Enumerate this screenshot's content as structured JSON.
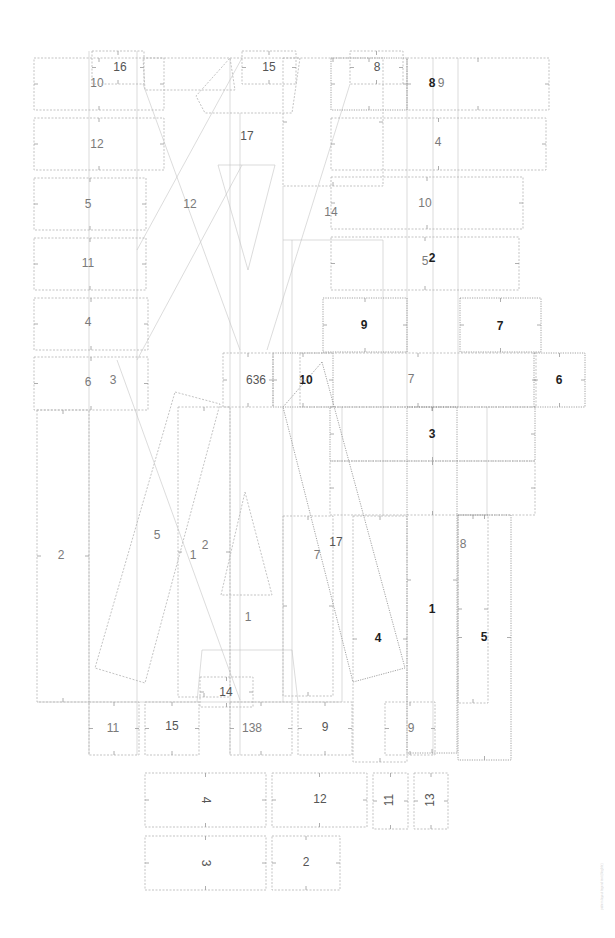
{
  "diagram": {
    "type": "sewing-pattern-layout",
    "background": "#ffffff",
    "stroke_color": "#b4b4b4",
    "label_colors": {
      "light": "#7a7a7a",
      "medium": "#555555",
      "bold": "#1e1e1e"
    },
    "footnote": "pattern layout legend text (illegible)",
    "pieces": [
      {
        "id": "p10a",
        "label": "10",
        "style": "light",
        "shape": "rect",
        "x": 34,
        "y": 58,
        "w": 130,
        "h": 52,
        "lx": 97,
        "ly": 84
      },
      {
        "id": "p16",
        "label": "16",
        "style": "medium",
        "shape": "rect",
        "x": 92,
        "y": 51,
        "w": 52,
        "h": 33,
        "lx": 120,
        "ly": 68
      },
      {
        "id": "p12a",
        "label": "12",
        "style": "light",
        "shape": "rect",
        "x": 34,
        "y": 118,
        "w": 130,
        "h": 52,
        "lx": 97,
        "ly": 145
      },
      {
        "id": "p5a",
        "label": "5",
        "style": "light",
        "shape": "rect",
        "x": 34,
        "y": 178,
        "w": 112,
        "h": 52,
        "lx": 88,
        "ly": 205
      },
      {
        "id": "p11a",
        "label": "11",
        "style": "light",
        "shape": "rect",
        "x": 34,
        "y": 238,
        "w": 112,
        "h": 52,
        "lx": 88,
        "ly": 264
      },
      {
        "id": "p4a",
        "label": "4",
        "style": "light",
        "shape": "rect",
        "x": 34,
        "y": 298,
        "w": 114,
        "h": 52,
        "lx": 88,
        "ly": 323
      },
      {
        "id": "p6a",
        "label": "6",
        "style": "light",
        "shape": "rect",
        "x": 34,
        "y": 357,
        "w": 114,
        "h": 53,
        "lx": 88,
        "ly": 383
      },
      {
        "id": "p3a",
        "label": "3",
        "style": "light",
        "shape": "none",
        "lx": 113,
        "ly": 381
      },
      {
        "id": "p2a",
        "label": "2",
        "style": "light",
        "shape": "rect",
        "x": 37,
        "y": 410,
        "w": 52,
        "h": 292,
        "lx": 61,
        "ly": 556
      },
      {
        "id": "p12b",
        "label": "12",
        "style": "light",
        "shape": "poly",
        "points": "143,58 230,58 235,90 145,90",
        "lx": 190,
        "ly": 205
      },
      {
        "id": "p15a",
        "label": "15",
        "style": "medium",
        "shape": "rect",
        "x": 242,
        "y": 51,
        "w": 54,
        "h": 33,
        "lx": 269,
        "ly": 68
      },
      {
        "id": "p17",
        "label": "17",
        "style": "medium",
        "shape": "poly",
        "points": "230,58 300,58 292,113 205,113 196,96",
        "lx": 247,
        "ly": 137
      },
      {
        "id": "p8a",
        "label": "8",
        "style": "medium",
        "shape": "rect",
        "x": 350,
        "y": 51,
        "w": 53,
        "h": 33,
        "lx": 377,
        "ly": 68
      },
      {
        "id": "p8b",
        "label": "8",
        "style": "bold",
        "shape": "rect",
        "x": 331,
        "y": 58,
        "w": 76,
        "h": 52,
        "lx": 432,
        "ly": 84
      },
      {
        "id": "p9a",
        "label": "9",
        "style": "light",
        "shape": "rect",
        "x": 407,
        "y": 58,
        "w": 142,
        "h": 52,
        "lx": 441,
        "ly": 84
      },
      {
        "id": "p4b",
        "label": "4",
        "style": "light",
        "shape": "rect",
        "x": 331,
        "y": 118,
        "w": 215,
        "h": 52,
        "lx": 438,
        "ly": 143
      },
      {
        "id": "p14a",
        "label": "14",
        "style": "light",
        "shape": "rect",
        "x": 283,
        "y": 58,
        "w": 100,
        "h": 128,
        "lx": 331,
        "ly": 213
      },
      {
        "id": "p10b",
        "label": "10",
        "style": "light",
        "shape": "rect",
        "x": 331,
        "y": 177,
        "w": 192,
        "h": 52,
        "lx": 425,
        "ly": 204
      },
      {
        "id": "p5b",
        "label": "5",
        "style": "light",
        "shape": "rect",
        "x": 331,
        "y": 237,
        "w": 188,
        "h": 53,
        "lx": 425,
        "ly": 262
      },
      {
        "id": "p2b",
        "label": "2",
        "style": "bold",
        "shape": "none",
        "lx": 432,
        "ly": 259
      },
      {
        "id": "p9b",
        "label": "9",
        "style": "bold",
        "shape": "rect",
        "x": 323,
        "y": 298,
        "w": 84,
        "h": 54,
        "lx": 364,
        "ly": 326
      },
      {
        "id": "p7a",
        "label": "7",
        "style": "bold",
        "shape": "rect",
        "x": 460,
        "y": 298,
        "w": 81,
        "h": 54,
        "lx": 500,
        "ly": 327
      },
      {
        "id": "p636",
        "label": "636",
        "style": "medium",
        "shape": "rect",
        "x": 223,
        "y": 353,
        "w": 50,
        "h": 54,
        "lx": 256,
        "ly": 381
      },
      {
        "id": "p10c",
        "label": "10",
        "style": "bold",
        "shape": "rect",
        "x": 273,
        "y": 353,
        "w": 60,
        "h": 54,
        "lx": 306,
        "ly": 381
      },
      {
        "id": "p7b",
        "label": "7",
        "style": "light",
        "shape": "rect",
        "x": 300,
        "y": 353,
        "w": 236,
        "h": 54,
        "lx": 411,
        "ly": 380
      },
      {
        "id": "p6b",
        "label": "6",
        "style": "bold",
        "shape": "rect",
        "x": 534,
        "y": 353,
        "w": 51,
        "h": 54,
        "lx": 559,
        "ly": 381
      },
      {
        "id": "p3b",
        "label": "3",
        "style": "bold",
        "shape": "rect",
        "x": 330,
        "y": 407,
        "w": 205,
        "h": 54,
        "lx": 432,
        "ly": 435
      },
      {
        "id": "p3c",
        "label": "",
        "style": "light",
        "shape": "rect",
        "x": 330,
        "y": 461,
        "w": 205,
        "h": 54
      },
      {
        "id": "p5c",
        "label": "5",
        "style": "light",
        "shape": "poly",
        "points": "175,392 220,404 145,683 95,668",
        "lx": 157,
        "ly": 536
      },
      {
        "id": "p1a",
        "label": "1",
        "style": "light",
        "shape": "rect",
        "x": 178,
        "y": 407,
        "w": 52,
        "h": 290,
        "lx": 193,
        "ly": 556
      },
      {
        "id": "p2c",
        "label": "2",
        "style": "light",
        "shape": "none",
        "lx": 205,
        "ly": 546
      },
      {
        "id": "p1b",
        "label": "1",
        "style": "light",
        "shape": "poly",
        "points": "245,492 272,595 221,595",
        "lx": 248,
        "ly": 618
      },
      {
        "id": "p7c",
        "label": "7",
        "style": "light",
        "shape": "rect",
        "x": 283,
        "y": 516,
        "w": 50,
        "h": 180,
        "lx": 317,
        "ly": 556
      },
      {
        "id": "p17b",
        "label": "17",
        "style": "medium",
        "shape": "none",
        "lx": 336,
        "ly": 543
      },
      {
        "id": "p4c",
        "label": "4",
        "style": "bold",
        "shape": "poly",
        "points": "322,362 405,668 353,682 283,407",
        "lx": 378,
        "ly": 639
      },
      {
        "id": "p4d",
        "label": "",
        "style": "light",
        "shape": "rect",
        "x": 353,
        "y": 516,
        "w": 54,
        "h": 246
      },
      {
        "id": "p1c",
        "label": "1",
        "style": "bold",
        "shape": "rect",
        "x": 407,
        "y": 407,
        "w": 50,
        "h": 346,
        "lx": 432,
        "ly": 610
      },
      {
        "id": "p8c",
        "label": "8",
        "style": "light",
        "shape": "rect",
        "x": 458,
        "y": 515,
        "w": 30,
        "h": 188,
        "lx": 463,
        "ly": 545
      },
      {
        "id": "p5d",
        "label": "5",
        "style": "bold",
        "shape": "rect",
        "x": 458,
        "y": 515,
        "w": 53,
        "h": 245,
        "lx": 484,
        "ly": 638
      },
      {
        "id": "p14b",
        "label": "14",
        "style": "medium",
        "shape": "rect",
        "x": 200,
        "y": 677,
        "w": 53,
        "h": 30,
        "lx": 226,
        "ly": 693
      },
      {
        "id": "p11b",
        "label": "11",
        "style": "light",
        "shape": "rect",
        "x": 89,
        "y": 702,
        "w": 50,
        "h": 53,
        "lx": 113,
        "ly": 729
      },
      {
        "id": "p15b",
        "label": "15",
        "style": "medium",
        "shape": "rect",
        "x": 145,
        "y": 702,
        "w": 54,
        "h": 53,
        "lx": 172,
        "ly": 727
      },
      {
        "id": "p138",
        "label": "138",
        "style": "light",
        "shape": "rect",
        "x": 230,
        "y": 702,
        "w": 62,
        "h": 53,
        "lx": 252,
        "ly": 729
      },
      {
        "id": "p9c",
        "label": "9",
        "style": "medium",
        "shape": "rect",
        "x": 298,
        "y": 702,
        "w": 54,
        "h": 53,
        "lx": 325,
        "ly": 728
      },
      {
        "id": "p9d",
        "label": "9",
        "style": "light",
        "shape": "rect",
        "x": 385,
        "y": 702,
        "w": 50,
        "h": 53,
        "lx": 411,
        "ly": 729
      },
      {
        "id": "p4e",
        "label": "4",
        "style": "medium",
        "shape": "rect",
        "x": 145,
        "y": 773,
        "w": 121,
        "h": 54,
        "lx": 205,
        "ly": 800,
        "rotate": 90
      },
      {
        "id": "p12c",
        "label": "12",
        "style": "medium",
        "shape": "rect",
        "x": 272,
        "y": 773,
        "w": 95,
        "h": 54,
        "lx": 320,
        "ly": 800
      },
      {
        "id": "p11c",
        "label": "11",
        "style": "medium",
        "shape": "rect",
        "x": 373,
        "y": 773,
        "w": 35,
        "h": 56,
        "lx": 390,
        "ly": 800,
        "rotate": -90
      },
      {
        "id": "p13",
        "label": "13",
        "style": "medium",
        "shape": "rect",
        "x": 414,
        "y": 773,
        "w": 34,
        "h": 56,
        "lx": 431,
        "ly": 800,
        "rotate": -90
      },
      {
        "id": "p3d",
        "label": "3",
        "style": "medium",
        "shape": "rect",
        "x": 145,
        "y": 836,
        "w": 121,
        "h": 54,
        "lx": 205,
        "ly": 863,
        "rotate": 90
      },
      {
        "id": "p2d",
        "label": "2",
        "style": "medium",
        "shape": "rect",
        "x": 272,
        "y": 836,
        "w": 68,
        "h": 54,
        "lx": 306,
        "ly": 863
      }
    ],
    "guide_lines": [
      {
        "x1": 143,
        "y1": 84,
        "x2": 240,
        "y2": 350
      },
      {
        "x1": 242,
        "y1": 58,
        "x2": 137,
        "y2": 250
      },
      {
        "x1": 242,
        "y1": 165,
        "x2": 137,
        "y2": 360
      },
      {
        "x1": 350,
        "y1": 84,
        "x2": 267,
        "y2": 350
      },
      {
        "x1": 117,
        "y1": 360,
        "x2": 240,
        "y2": 700
      },
      {
        "x1": 218,
        "y1": 165,
        "x2": 275,
        "y2": 165
      },
      {
        "x1": 218,
        "y1": 165,
        "x2": 248,
        "y2": 270
      },
      {
        "x1": 275,
        "y1": 165,
        "x2": 248,
        "y2": 270
      },
      {
        "x1": 230,
        "y1": 58,
        "x2": 230,
        "y2": 755
      },
      {
        "x1": 240,
        "y1": 113,
        "x2": 240,
        "y2": 755
      },
      {
        "x1": 283,
        "y1": 186,
        "x2": 283,
        "y2": 702
      },
      {
        "x1": 292,
        "y1": 240,
        "x2": 292,
        "y2": 702
      },
      {
        "x1": 383,
        "y1": 240,
        "x2": 383,
        "y2": 516
      },
      {
        "x1": 283,
        "y1": 240,
        "x2": 383,
        "y2": 240
      },
      {
        "x1": 89,
        "y1": 51,
        "x2": 89,
        "y2": 755
      },
      {
        "x1": 137,
        "y1": 51,
        "x2": 137,
        "y2": 755
      },
      {
        "x1": 433,
        "y1": 58,
        "x2": 433,
        "y2": 755
      },
      {
        "x1": 407,
        "y1": 58,
        "x2": 407,
        "y2": 407
      },
      {
        "x1": 458,
        "y1": 58,
        "x2": 458,
        "y2": 407
      },
      {
        "x1": 487,
        "y1": 407,
        "x2": 487,
        "y2": 515
      },
      {
        "x1": 342,
        "y1": 407,
        "x2": 342,
        "y2": 702
      },
      {
        "x1": 202,
        "y1": 650,
        "x2": 292,
        "y2": 650
      },
      {
        "x1": 202,
        "y1": 650,
        "x2": 197,
        "y2": 702
      },
      {
        "x1": 292,
        "y1": 650,
        "x2": 298,
        "y2": 702
      },
      {
        "x1": 37,
        "y1": 702,
        "x2": 340,
        "y2": 702
      }
    ]
  }
}
